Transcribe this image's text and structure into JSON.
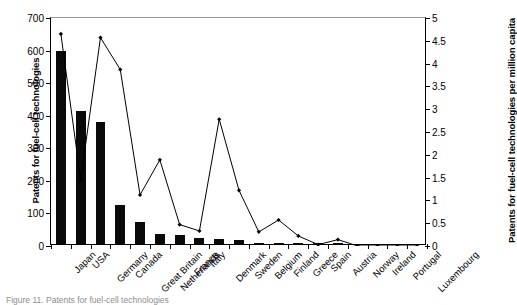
{
  "chart_data": {
    "type": "bar",
    "title": "",
    "xlabel": "",
    "ylabel": "Patents for fuel-cell technologies",
    "y2label": "Patents for fuel-cell technologies per million capita",
    "ylim": [
      0,
      700
    ],
    "y2lim": [
      0,
      5
    ],
    "yticks": [
      0,
      100,
      200,
      300,
      400,
      500,
      600,
      700
    ],
    "y2ticks": [
      0,
      0.5,
      1,
      1.5,
      2,
      2.5,
      3,
      3.5,
      4,
      4.5,
      5
    ],
    "grid": false,
    "legend_position": "none",
    "categories": [
      "Japan",
      "USA",
      "Germany",
      "Canada",
      "Great Britain",
      "Netherlands",
      "France",
      "Italy",
      "Denmark",
      "Sweden",
      "Belgium",
      "Finland",
      "Greece",
      "Spain",
      "Austria",
      "Norway",
      "Ireland",
      "Portugal",
      "Luxembourg"
    ],
    "series": [
      {
        "name": "Patents for fuel-cell technologies",
        "render": "bar",
        "axis": "left",
        "color": "#0a0a0a",
        "values": [
          592,
          408,
          376,
          121,
          68,
          30,
          29,
          19,
          14,
          11,
          4,
          3,
          2,
          1,
          1,
          0,
          0,
          0,
          0
        ]
      },
      {
        "name": "Patents for fuel-cell technologies per million capita",
        "render": "line",
        "axis": "right",
        "color": "#000000",
        "marker": "diamond",
        "values": [
          4.65,
          1.45,
          4.57,
          3.87,
          1.12,
          1.89,
          0.47,
          0.33,
          2.78,
          1.22,
          0.31,
          0.57,
          0.22,
          0.03,
          0.14,
          0.0,
          0.0,
          0.0,
          0.0
        ]
      }
    ]
  },
  "caption": {
    "text": "Figure 11. Patents for fuel-cell technologies"
  }
}
